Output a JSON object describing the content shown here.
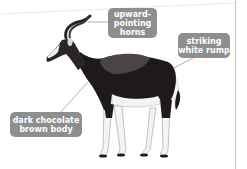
{
  "diagram": {
    "labels": [
      {
        "id": "horns",
        "lines": [
          "upward-",
          "pointing",
          "horns"
        ]
      },
      {
        "id": "rump",
        "lines": [
          "striking",
          "white rump"
        ]
      },
      {
        "id": "body",
        "lines": [
          "dark chocolate",
          "brown body"
        ]
      }
    ]
  },
  "colors": {
    "label_bg": "#8e8e8e",
    "label_text": "#ffffff",
    "body_dark": "#1e1a1c",
    "saddle": "#4a4448",
    "white_patches": "#f4f4f4",
    "leader_line": "#9a9a9a",
    "page_edge": "#c4c4c4"
  }
}
